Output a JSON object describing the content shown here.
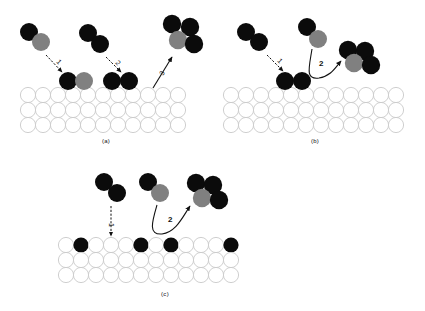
{
  "figure": {
    "type": "schematic-diagram",
    "background_color": "#ffffff",
    "colors": {
      "dark_atom": "#0b0b0b",
      "gray_atom": "#808080",
      "substrate_atom_fill": "#ffffff",
      "substrate_atom_stroke": "#c9c9c9",
      "arrow": "#111111"
    }
  },
  "panels": [
    {
      "id": "a",
      "label": "(a)",
      "substrate": {
        "rows": 3,
        "columns": 11
      },
      "process_arrows": [
        {
          "number": "1",
          "style": "dashed",
          "direction": "down-right",
          "meaning": "impinging dimer adsorbs on surface"
        },
        {
          "number": "2",
          "style": "dashed",
          "direction": "down-right",
          "meaning": "second dimer adsorbs on surface"
        },
        {
          "number": "3",
          "style": "solid",
          "direction": "up-right",
          "meaning": "cluster desorbs from surface"
        }
      ],
      "incoming_species": [
        {
          "name": "mixed-dimer",
          "atoms": [
            "dark",
            "gray"
          ]
        },
        {
          "name": "dark-dimer",
          "atoms": [
            "dark",
            "dark"
          ]
        }
      ],
      "adsorbed_species": [
        {
          "name": "mixed-dimer-adsorbed",
          "atoms": [
            "dark",
            "gray"
          ]
        },
        {
          "name": "dark-dimer-adsorbed",
          "atoms": [
            "dark",
            "dark"
          ]
        }
      ],
      "cluster": {
        "name": "tetramer-cluster",
        "atoms": [
          "dark",
          "dark",
          "gray",
          "dark"
        ]
      }
    },
    {
      "id": "b",
      "label": "(b)",
      "substrate": {
        "rows": 3,
        "columns": 12
      },
      "process_arrows": [
        {
          "number": "1",
          "style": "dashed",
          "direction": "down-right",
          "meaning": "impinging dimer adsorbs on surface"
        },
        {
          "number": "2",
          "style": "solid-curved",
          "direction": "up-right",
          "meaning": "adsorbed dimer joins growing cluster"
        }
      ],
      "incoming_species": [
        {
          "name": "dark-dimer",
          "atoms": [
            "dark",
            "dark"
          ]
        },
        {
          "name": "mixed-dimer",
          "atoms": [
            "dark",
            "gray"
          ]
        }
      ],
      "adsorbed_species": [
        {
          "name": "dark-dimer-adsorbed",
          "atoms": [
            "dark",
            "dark"
          ]
        }
      ],
      "cluster": {
        "name": "tetramer-cluster",
        "atoms": [
          "dark",
          "dark",
          "gray",
          "dark"
        ]
      }
    },
    {
      "id": "c",
      "label": "(c)",
      "substrate": {
        "rows": 3,
        "columns": 11
      },
      "process_arrows": [
        {
          "number": "1",
          "style": "dashed-vertical",
          "direction": "down",
          "meaning": "dimer incorporates substitutionally into surface layer"
        },
        {
          "number": "2",
          "style": "solid-curved",
          "direction": "up-right",
          "meaning": "mixed dimer joins growing cluster"
        }
      ],
      "incoming_species": [
        {
          "name": "dark-dimer",
          "atoms": [
            "dark",
            "dark"
          ]
        },
        {
          "name": "mixed-dimer",
          "atoms": [
            "dark",
            "gray"
          ]
        }
      ],
      "substituted_sites": {
        "count": 4,
        "atom": "dark",
        "row": "top"
      },
      "cluster": {
        "name": "tetramer-cluster",
        "atoms": [
          "dark",
          "dark",
          "gray",
          "dark"
        ]
      }
    }
  ]
}
